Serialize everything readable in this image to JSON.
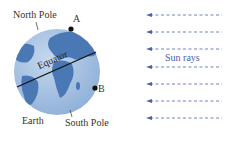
{
  "diagram": {
    "labels": {
      "north_pole": "North Pole",
      "south_pole": "South Pole",
      "equator": "Equator",
      "earth": "Earth",
      "point_a": "A",
      "point_b": "B",
      "sun_rays": "Sun rays"
    },
    "ray_count": 7,
    "colors": {
      "ocean": "#9ab8dc",
      "land": "#4a78b4",
      "rays": "#4a62b0",
      "equator_line": "#111111",
      "text": "#333333",
      "ray_label": "#4a62b0"
    }
  }
}
